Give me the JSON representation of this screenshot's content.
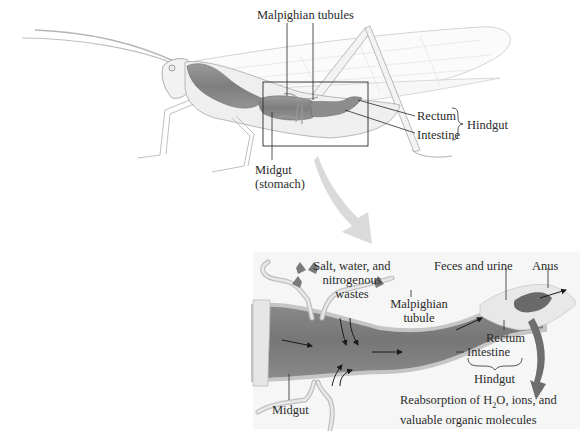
{
  "figure": {
    "top_panel": {
      "subject": "grasshopper",
      "labels": {
        "malpighian_tubules": "Malpighian tubules",
        "rectum": "Rectum",
        "intestine": "Intestine",
        "hindgut": "Hindgut",
        "midgut_line1": "Midgut",
        "midgut_line2": "(stomach)"
      }
    },
    "bottom_panel": {
      "labels": {
        "salt_line1": "Salt, water, and",
        "salt_line2": "nitrogenous",
        "salt_line3": "wastes",
        "malpighian_line1": "Malpighian",
        "malpighian_line2": "tubule",
        "feces": "Feces and urine",
        "anus": "Anus",
        "rectum": "Rectum",
        "intestine": "Intestine",
        "hindgut": "Hindgut",
        "midgut": "Midgut",
        "reabsorption_line1_a": "Reabsorption of H",
        "reabsorption_sub": "2",
        "reabsorption_line1_b": "O, ions, and",
        "reabsorption_line2": "valuable organic molecules"
      }
    },
    "colors": {
      "gut": "#8a8a8a",
      "gut_dark": "#6e6e6e",
      "outline": "#9a9a9a",
      "arrow_gray": "#7a7a7a",
      "callout_arrow": "#d8d8d8",
      "text": "#2b2b2b"
    }
  }
}
